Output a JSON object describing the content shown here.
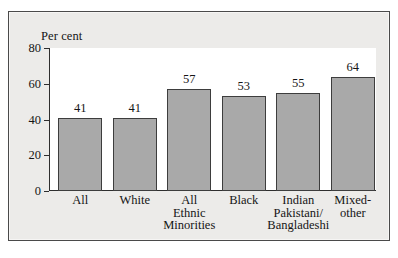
{
  "chart_data": {
    "type": "bar",
    "title": "",
    "xlabel": "",
    "ylabel": "Per cent",
    "ylim": [
      0,
      80
    ],
    "yticks": [
      0,
      20,
      40,
      60,
      80
    ],
    "grid": false,
    "legend": "none",
    "categories": [
      "All",
      "White",
      "All\nEthnic\nMinorities",
      "Black",
      "Indian\nPakistani/\nBangladeshi",
      "Mixed-\nother"
    ],
    "values": [
      41,
      41,
      57,
      53,
      55,
      64
    ],
    "value_labels": [
      "41",
      "41",
      "57",
      "53",
      "55",
      "64"
    ],
    "tick_labels": [
      "0",
      "20",
      "40",
      "60",
      "80"
    ],
    "colors": {
      "bar_fill": "#a9a9a9",
      "bar_stroke": "#3d3d3d",
      "axis": "#2e2e2e",
      "text": "#151515",
      "figure_background": "#ecebe9",
      "plot_background": "#ffffff",
      "frame_border": "#4a4a4a"
    }
  }
}
